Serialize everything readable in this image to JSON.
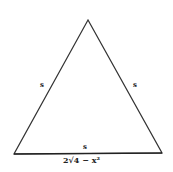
{
  "diagram": {
    "shape": "equilateral-triangle",
    "labels": {
      "left_side": "s",
      "right_side": "s",
      "base_inside": "s",
      "base_below": "2√4 − x²"
    },
    "colors": {
      "stroke": "#333333",
      "background": "#ffffff"
    }
  }
}
